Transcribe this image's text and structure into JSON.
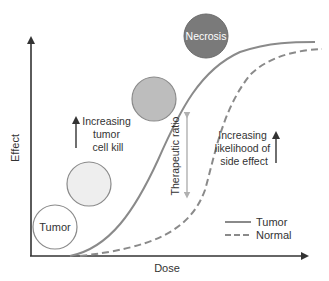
{
  "diagram": {
    "type": "dose-response",
    "axes": {
      "x_label": "Dose",
      "y_label": "Effect"
    },
    "circles": [
      {
        "label": "Tumor",
        "fill": "#ffffff"
      },
      {
        "label": "",
        "fill": "#eeeeee"
      },
      {
        "label": "",
        "fill": "#bdbdbd"
      },
      {
        "label": "Necrosis",
        "fill": "#7a7a7a"
      }
    ],
    "annotations": {
      "tumor_kill": [
        "Increasing",
        "tumor",
        "cell kill"
      ],
      "side_effect": [
        "Increasing",
        "likelihood of",
        "side effect"
      ],
      "therapeutic_ratio": "Therapeutic ratio"
    },
    "legend": [
      {
        "label": "Tumor",
        "style": "solid"
      },
      {
        "label": "Normal",
        "style": "dashed"
      }
    ],
    "colors": {
      "curve": "#8a8a8a",
      "axis": "#333333",
      "ratio_arrow": "#b0b0b0"
    }
  }
}
